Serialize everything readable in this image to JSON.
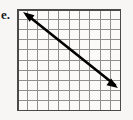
{
  "figure": {
    "label": "e.",
    "background_color": "#f7f6f4"
  },
  "chart_data": {
    "type": "line",
    "title": "",
    "xlabel": "",
    "ylabel": "",
    "grid": {
      "visible": true,
      "columns": 10,
      "rows": 10,
      "cell_width": 10.4,
      "cell_height": 10.2,
      "line_color": "#8f8f8f",
      "border_color": "#4a4a4a",
      "x_origin": 17,
      "y_origin": 9,
      "width": 104,
      "height": 102
    },
    "axis_labels_visible": false,
    "tick_labels": [],
    "legend": null,
    "xlim": [
      0,
      10
    ],
    "ylim": [
      0,
      10
    ],
    "series": [
      {
        "name": "line-e",
        "style": "double-headed-arrow",
        "color": "#000000",
        "stroke_width": 2.6,
        "slope": -0.8,
        "endpoints_px": [
          [
            7,
            4
          ],
          [
            100,
            78
          ]
        ],
        "endpoints_grid": [
          [
            0.7,
            9.6
          ],
          [
            9.6,
            2.4
          ]
        ],
        "arrowhead_start": true,
        "arrowhead_end": true
      }
    ]
  }
}
